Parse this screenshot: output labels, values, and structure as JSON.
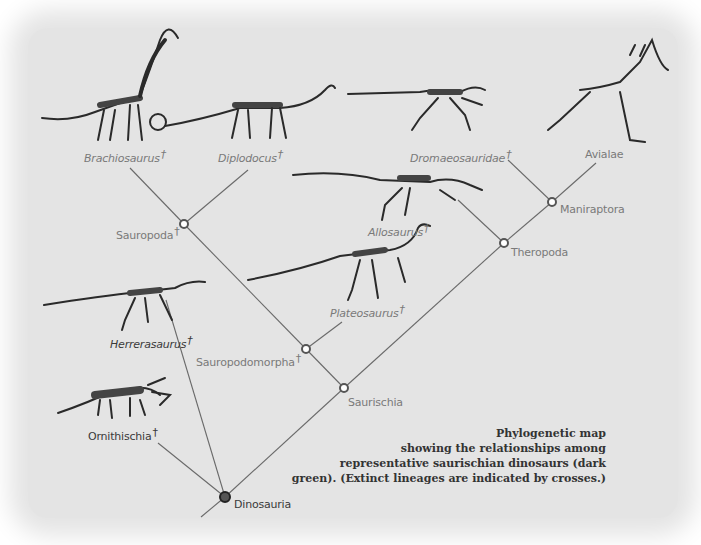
{
  "diagram": {
    "type": "phylogenetic cladogram",
    "extinct_marker": "†",
    "colors": {
      "background": "#e4e4e4",
      "line": "#6a6a6a",
      "label": "#7a7a7a",
      "label_dark": "#3a3a3a",
      "caption": "#333333",
      "node_fill": "#ffffff",
      "node_stroke": "#555555",
      "root_node": "#222222"
    },
    "taxa": [
      {
        "id": "brachiosaurus",
        "label": "Brachiosaurus",
        "italic": true,
        "extinct": true
      },
      {
        "id": "diplodocus",
        "label": "Diplodocus",
        "italic": true,
        "extinct": true
      },
      {
        "id": "dromaeosauridae",
        "label": "Dromaeosauridae",
        "italic": true,
        "extinct": true
      },
      {
        "id": "avialae",
        "label": "Avialae",
        "italic": false,
        "extinct": false
      },
      {
        "id": "allosaurus",
        "label": "Allosaurus",
        "italic": true,
        "extinct": true
      },
      {
        "id": "plateosaurus",
        "label": "Plateosaurus",
        "italic": true,
        "extinct": true
      },
      {
        "id": "herrerasaurus",
        "label": "Herrerasaurus",
        "italic": true,
        "extinct": true
      },
      {
        "id": "ornithischia",
        "label": "Ornithischia",
        "italic": false,
        "extinct": true
      }
    ],
    "nodes": [
      {
        "id": "sauropoda",
        "label": "Sauropoda",
        "extinct": true
      },
      {
        "id": "maniraptora",
        "label": "Maniraptora",
        "extinct": false
      },
      {
        "id": "theropoda",
        "label": "Theropoda",
        "extinct": false
      },
      {
        "id": "sauropodomorpha",
        "label": "Sauropodomorpha",
        "extinct": true
      },
      {
        "id": "saurischia",
        "label": "Saurischia",
        "extinct": false
      },
      {
        "id": "dinosauria",
        "label": "Dinosauria",
        "extinct": false
      }
    ],
    "caption": {
      "lines": [
        "Phylogenetic map",
        "showing the relationships among",
        "representative saurischian dinosaurs (dark",
        "green). (Extinct lineages are indicated by crosses.)"
      ]
    }
  }
}
